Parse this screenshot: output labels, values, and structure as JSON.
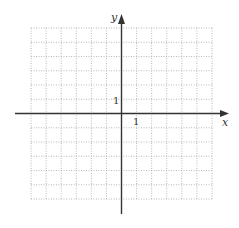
{
  "graph": {
    "x_axis_label": "x",
    "y_axis_label": "y",
    "x_unit_label": "1",
    "y_unit_label": "1",
    "grid": {
      "columns": 12,
      "rows": 12,
      "x_range": [
        -6,
        6
      ],
      "y_range": [
        -6,
        6
      ],
      "line_style": "dotted",
      "line_color": "#b8b8b8"
    },
    "axis_color": "#333333"
  }
}
